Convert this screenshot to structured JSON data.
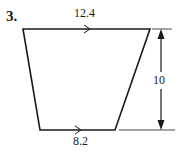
{
  "problem": {
    "number": "3."
  },
  "figure": {
    "shape": "trapezoid",
    "top_base_label": "12.4",
    "bottom_base_label": "8.2",
    "height_label": "10",
    "stroke_color": "#1a1a1a",
    "background_color": "#ffffff"
  }
}
